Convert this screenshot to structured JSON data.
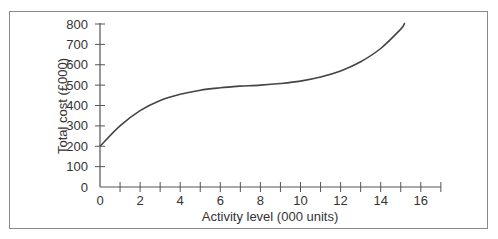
{
  "chart_data": {
    "type": "line",
    "title": "",
    "xlabel": "Activity level (000 units)",
    "ylabel": "Total cost (£000)",
    "xlim": [
      0,
      17
    ],
    "ylim": [
      0,
      800
    ],
    "x_ticks": [
      0,
      2,
      4,
      6,
      8,
      10,
      12,
      14,
      16
    ],
    "x_minor_ticks": [
      1,
      3,
      5,
      7,
      9,
      11,
      13,
      15,
      17
    ],
    "y_ticks": [
      0,
      100,
      200,
      300,
      400,
      500,
      600,
      700,
      800
    ],
    "grid": false,
    "legend": null,
    "series": [
      {
        "name": "Total cost",
        "x": [
          0,
          1,
          2,
          3,
          4,
          5,
          6,
          7,
          8,
          9,
          10,
          11,
          12,
          13,
          14,
          15,
          15.2
        ],
        "values": [
          200,
          300,
          375,
          425,
          455,
          475,
          487,
          495,
          500,
          508,
          520,
          540,
          570,
          615,
          680,
          775,
          805
        ]
      }
    ],
    "color": "#444444"
  },
  "axes": {
    "x_title": "Activity level (000 units)",
    "y_title": "Total cost (£000)",
    "x_tick_labels": [
      "0",
      "2",
      "4",
      "6",
      "8",
      "10",
      "12",
      "14",
      "16"
    ],
    "y_tick_labels": [
      "0",
      "100",
      "200",
      "300",
      "400",
      "500",
      "600",
      "700",
      "800"
    ]
  }
}
